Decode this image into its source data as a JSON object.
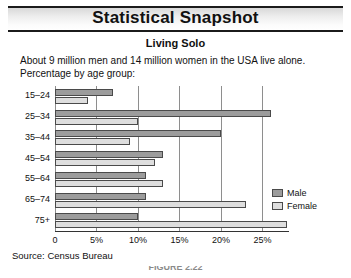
{
  "header": {
    "title": "Statistical Snapshot"
  },
  "subtitle": "Living Solo",
  "description": {
    "line1": "About 9 million men and 14 million women in the USA live alone.",
    "line2": "Percentage by age group:"
  },
  "source": "Source: Census Bureau",
  "caption": "FIGURE 2.22",
  "colors": {
    "male": "#9c9c9c",
    "female": "#dedede",
    "bar_outline": "#4a4a4a",
    "gridline": "#8e8e8e",
    "axis": "#333333"
  },
  "legend": {
    "position": "right",
    "items": [
      {
        "label": "Male",
        "color": "#9c9c9c"
      },
      {
        "label": "Female",
        "color": "#dedede"
      }
    ]
  },
  "chart_data": {
    "type": "bar",
    "orientation": "horizontal",
    "title": "Living Solo",
    "subtitle": "About 9 million men and 14 million women in the USA live alone. Percentage by age group:",
    "xlabel": "",
    "ylabel": "",
    "xlim": [
      0,
      28.2
    ],
    "grid": true,
    "xticks": [
      0,
      5,
      10,
      15,
      20,
      25
    ],
    "xticklabels": [
      "0",
      "5%",
      "10%",
      "15%",
      "20%",
      "25%"
    ],
    "categories": [
      "15–24",
      "25–34",
      "35–44",
      "45–54",
      "55–64",
      "65–74",
      "75+"
    ],
    "series": [
      {
        "name": "Male",
        "values": [
          7.0,
          26.0,
          20.0,
          13.0,
          11.0,
          11.0,
          10.0
        ]
      },
      {
        "name": "Female",
        "values": [
          4.0,
          10.0,
          9.0,
          12.0,
          13.0,
          23.0,
          28.0
        ]
      }
    ]
  }
}
